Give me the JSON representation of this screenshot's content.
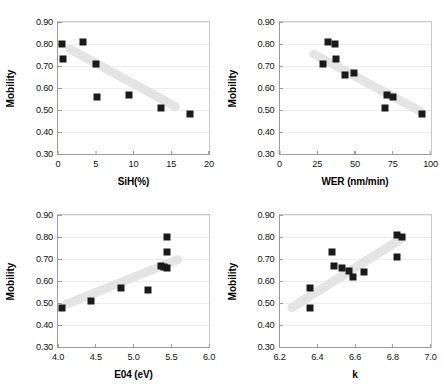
{
  "figure": {
    "ylabel": "Mobility",
    "yticks": [
      "0.30",
      "0.40",
      "0.50",
      "0.60",
      "0.70",
      "0.80",
      "0.90"
    ],
    "ylim": [
      0.3,
      0.9
    ]
  },
  "chart_data": [
    {
      "type": "scatter",
      "panel": "top-left",
      "title": "",
      "xlabel": "SiH(%)",
      "ylabel": "Mobility",
      "xlim": [
        0,
        20
      ],
      "ylim": [
        0.3,
        0.9
      ],
      "xticks": [
        "0",
        "5",
        "10",
        "15",
        "20"
      ],
      "xtickvals": [
        0,
        5,
        10,
        15,
        20
      ],
      "yticks": [
        "0.30",
        "0.40",
        "0.50",
        "0.60",
        "0.70",
        "0.80",
        "0.90"
      ],
      "ytickvals": [
        0.3,
        0.4,
        0.5,
        0.6,
        0.7,
        0.8,
        0.9
      ],
      "grid": true,
      "legend": "none",
      "x": [
        0.5,
        0.6,
        3.3,
        5.0,
        5.2,
        9.4,
        13.6,
        17.5
      ],
      "y": [
        0.8,
        0.73,
        0.81,
        0.71,
        0.56,
        0.57,
        0.51,
        0.48
      ],
      "trendline": {
        "x0": 1.0,
        "y0": 0.785,
        "x1": 16.0,
        "y1": 0.505
      }
    },
    {
      "type": "scatter",
      "panel": "top-right",
      "title": "",
      "xlabel": "WER (nm/min)",
      "ylabel": "Mobility",
      "xlim": [
        0,
        100
      ],
      "ylim": [
        0.3,
        0.9
      ],
      "xticks": [
        "0",
        "25",
        "50",
        "75",
        "100"
      ],
      "xtickvals": [
        0,
        25,
        50,
        75,
        100
      ],
      "yticks": [
        "0.30",
        "0.40",
        "0.50",
        "0.60",
        "0.70",
        "0.80",
        "0.90"
      ],
      "ytickvals": [
        0.3,
        0.4,
        0.5,
        0.6,
        0.7,
        0.8,
        0.9
      ],
      "grid": true,
      "legend": "none",
      "x": [
        28.5,
        32.0,
        37.0,
        37.5,
        43.5,
        49.5,
        70.0,
        71.5,
        75.0,
        94.5
      ],
      "y": [
        0.71,
        0.81,
        0.8,
        0.73,
        0.66,
        0.67,
        0.51,
        0.57,
        0.56,
        0.48
      ],
      "trendline": {
        "x0": 20.0,
        "y0": 0.765,
        "x1": 96.0,
        "y1": 0.485
      }
    },
    {
      "type": "scatter",
      "panel": "bottom-left",
      "title": "",
      "xlabel": "E04 (eV)",
      "ylabel": "Mobility",
      "xlim": [
        4.0,
        6.0
      ],
      "ylim": [
        0.3,
        0.9
      ],
      "xticks": [
        "4.0",
        "4.5",
        "5.0",
        "5.5",
        "6.0"
      ],
      "xtickvals": [
        4.0,
        4.5,
        5.0,
        5.5,
        6.0
      ],
      "yticks": [
        "0.30",
        "0.40",
        "0.50",
        "0.60",
        "0.70",
        "0.80",
        "0.90"
      ],
      "ytickvals": [
        0.3,
        0.4,
        0.5,
        0.6,
        0.7,
        0.8,
        0.9
      ],
      "grid": true,
      "legend": "none",
      "x": [
        4.05,
        4.44,
        4.83,
        5.19,
        5.36,
        5.4,
        5.44,
        5.45,
        5.45
      ],
      "y": [
        0.478,
        0.51,
        0.57,
        0.56,
        0.67,
        0.665,
        0.66,
        0.73,
        0.8
      ],
      "trendline": {
        "x0": 4.05,
        "y0": 0.487,
        "x1": 5.63,
        "y1": 0.705
      }
    },
    {
      "type": "scatter",
      "panel": "bottom-right",
      "title": "",
      "xlabel": "k",
      "ylabel": "Mobility",
      "xlim": [
        6.2,
        7.0
      ],
      "ylim": [
        0.3,
        0.9
      ],
      "xticks": [
        "6.2",
        "6.4",
        "6.6",
        "6.8",
        "7.0"
      ],
      "xtickvals": [
        6.2,
        6.4,
        6.6,
        6.8,
        7.0
      ],
      "yticks": [
        "0.30",
        "0.40",
        "0.50",
        "0.60",
        "0.70",
        "0.80",
        "0.90"
      ],
      "ytickvals": [
        0.3,
        0.4,
        0.5,
        0.6,
        0.7,
        0.8,
        0.9
      ],
      "grid": true,
      "legend": "none",
      "x": [
        6.36,
        6.36,
        6.48,
        6.49,
        6.53,
        6.57,
        6.59,
        6.65,
        6.82,
        6.82,
        6.85
      ],
      "y": [
        0.57,
        0.478,
        0.73,
        0.67,
        0.66,
        0.645,
        0.617,
        0.64,
        0.81,
        0.71,
        0.8
      ],
      "trendline": {
        "x0": 6.245,
        "y0": 0.468,
        "x1": 6.87,
        "y1": 0.805
      }
    }
  ]
}
